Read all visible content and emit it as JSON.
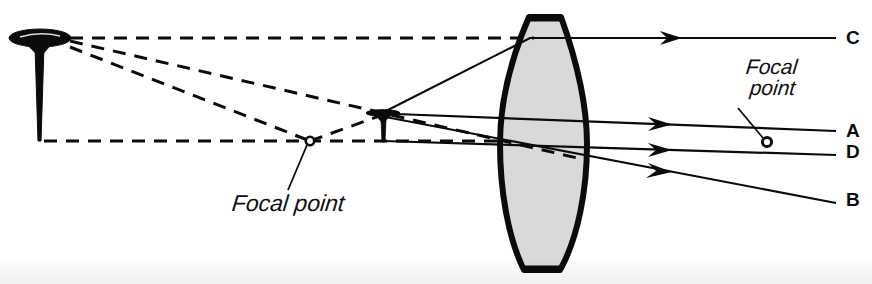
{
  "figure": {
    "background_color": "#ffffff",
    "ink_color": "#0b0b0b",
    "lens_fill_color": "#d8d8d8",
    "width": 872,
    "height": 284
  },
  "annotations": {
    "focal_point_left": "Focal point",
    "focal_point_right_line1": "Focal",
    "focal_point_right_line2": "point"
  },
  "ray_labels": {
    "c": "C",
    "a": "A",
    "d": "D",
    "b": "B"
  },
  "objects": {
    "tack_large": {
      "name": "thumbtack-object",
      "head_center_x": 40,
      "head_center_y": 38,
      "head_width": 62,
      "head_height": 17,
      "tip_y": 141
    },
    "tack_small": {
      "name": "thumbtack-image",
      "head_center_x": 383,
      "head_center_y": 113,
      "head_width": 34,
      "head_height": 7,
      "tip_y": 142
    },
    "lens": {
      "name": "biconvex-lens",
      "left_x": 500,
      "right_x": 587,
      "top_y": 17,
      "bottom_y": 271,
      "center_x": 543,
      "center_y": 144
    },
    "focal_point_left_marker": {
      "cx": 310,
      "cy": 141,
      "r": 4
    },
    "focal_point_right_marker": {
      "cx": 767,
      "cy": 142,
      "r": 4.5
    }
  },
  "geometry": {
    "optical_axis_y": 141,
    "dashed_rays": [
      {
        "name": "dashed-axis-ray",
        "points": "44,141 500,141"
      },
      {
        "name": "dashed-top-ray",
        "points": "70,38 533,38"
      },
      {
        "name": "dashed-object-upper",
        "points": "70,40 383,113 585,160"
      },
      {
        "name": "dashed-object-lower",
        "points": "70,45 310,141 383,114"
      }
    ],
    "solid_rays": [
      {
        "name": "ray-c",
        "points": "383,113 529,38 836,38",
        "arrow_at": [
          675,
          38
        ]
      },
      {
        "name": "ray-a",
        "points": "383,114 836,131",
        "arrow_at": [
          665,
          124
        ]
      },
      {
        "name": "ray-d",
        "points": "383,141 836,155",
        "arrow_at": [
          665,
          150
        ]
      },
      {
        "name": "ray-b",
        "points": "383,117 836,203",
        "arrow_at": [
          665,
          170
        ]
      }
    ]
  }
}
